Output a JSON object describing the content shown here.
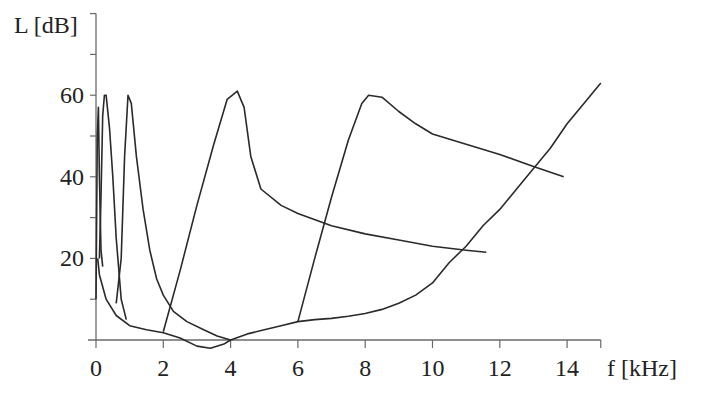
{
  "chart_data": {
    "type": "line",
    "title": "",
    "xlabel": "f [kHz]",
    "ylabel": "L [dB]",
    "xlim": [
      0,
      15
    ],
    "ylim": [
      0,
      80
    ],
    "grid": false,
    "legend": null,
    "x_ticks": [
      0,
      2,
      4,
      6,
      8,
      10,
      12,
      14
    ],
    "y_ticks_labeled": [
      20,
      40,
      60
    ],
    "y_ticks_minor": [
      10,
      30,
      50,
      70,
      80
    ],
    "series": [
      {
        "name": "threshold-in-quiet",
        "description": "Absolute hearing threshold curve",
        "points": [
          [
            0.05,
            20
          ],
          [
            0.1,
            16
          ],
          [
            0.3,
            10
          ],
          [
            0.6,
            6
          ],
          [
            1.0,
            3.5
          ],
          [
            1.5,
            2.5
          ],
          [
            2.0,
            1.8
          ],
          [
            2.5,
            0.5
          ],
          [
            3.0,
            -1.5
          ],
          [
            3.4,
            -2
          ],
          [
            3.8,
            -1
          ],
          [
            4.0,
            0
          ],
          [
            4.5,
            1.5
          ],
          [
            5.0,
            2.5
          ],
          [
            5.5,
            3.5
          ],
          [
            6.0,
            4.5
          ],
          [
            6.5,
            5
          ],
          [
            7.0,
            5.3
          ],
          [
            7.5,
            5.8
          ],
          [
            8.0,
            6.5
          ],
          [
            8.5,
            7.5
          ],
          [
            9.0,
            9
          ],
          [
            9.5,
            11
          ],
          [
            10.0,
            14
          ],
          [
            10.5,
            19
          ],
          [
            11.0,
            23
          ],
          [
            11.5,
            28
          ],
          [
            12.0,
            32
          ],
          [
            12.5,
            37
          ],
          [
            13.0,
            42
          ],
          [
            13.5,
            47
          ],
          [
            14.0,
            53
          ],
          [
            14.5,
            58
          ],
          [
            15.0,
            63
          ]
        ]
      },
      {
        "name": "masking-curve-0.07kHz",
        "masker_frequency_khz": 0.07,
        "peak_db": 57,
        "points": [
          [
            0.0,
            10
          ],
          [
            0.04,
            50
          ],
          [
            0.07,
            57
          ],
          [
            0.1,
            40
          ],
          [
            0.15,
            22
          ],
          [
            0.2,
            18
          ]
        ]
      },
      {
        "name": "masking-curve-0.25kHz",
        "masker_frequency_khz": 0.25,
        "peak_db": 60,
        "points": [
          [
            0.1,
            20
          ],
          [
            0.15,
            35
          ],
          [
            0.2,
            55
          ],
          [
            0.25,
            60
          ],
          [
            0.3,
            60
          ],
          [
            0.4,
            52
          ],
          [
            0.5,
            40
          ],
          [
            0.6,
            25
          ],
          [
            0.75,
            10
          ],
          [
            0.9,
            5
          ]
        ]
      },
      {
        "name": "masking-curve-1kHz",
        "masker_frequency_khz": 1.0,
        "peak_db": 60,
        "points": [
          [
            0.6,
            9
          ],
          [
            0.75,
            20
          ],
          [
            0.85,
            45
          ],
          [
            0.95,
            60
          ],
          [
            1.05,
            58
          ],
          [
            1.2,
            45
          ],
          [
            1.4,
            32
          ],
          [
            1.6,
            22
          ],
          [
            1.8,
            15
          ],
          [
            2.0,
            11
          ],
          [
            2.3,
            7
          ],
          [
            2.7,
            4.5
          ],
          [
            3.2,
            2.5
          ],
          [
            3.6,
            1
          ],
          [
            4.0,
            0
          ]
        ]
      },
      {
        "name": "masking-curve-4kHz",
        "masker_frequency_khz": 4.0,
        "peak_db": 61,
        "points": [
          [
            2.0,
            2
          ],
          [
            2.5,
            17
          ],
          [
            3.0,
            33
          ],
          [
            3.5,
            48
          ],
          [
            3.9,
            59
          ],
          [
            4.2,
            61
          ],
          [
            4.4,
            57
          ],
          [
            4.6,
            45
          ],
          [
            4.9,
            37
          ],
          [
            5.5,
            33
          ],
          [
            6.0,
            31
          ],
          [
            7.0,
            28
          ],
          [
            8.0,
            26
          ],
          [
            9.0,
            24.5
          ],
          [
            10.0,
            23
          ],
          [
            11.0,
            22
          ],
          [
            11.6,
            21.5
          ]
        ]
      },
      {
        "name": "masking-curve-8kHz",
        "masker_frequency_khz": 8.0,
        "peak_db": 60,
        "points": [
          [
            6.0,
            4.5
          ],
          [
            6.5,
            20
          ],
          [
            7.0,
            35
          ],
          [
            7.5,
            49
          ],
          [
            7.9,
            58
          ],
          [
            8.1,
            60
          ],
          [
            8.5,
            59.5
          ],
          [
            9.0,
            56
          ],
          [
            9.5,
            53
          ],
          [
            10.0,
            50.5
          ],
          [
            11.0,
            48
          ],
          [
            12.0,
            45.5
          ],
          [
            13.0,
            42.5
          ],
          [
            13.9,
            40
          ]
        ]
      }
    ]
  },
  "axes": {
    "ylabel": "L [dB]",
    "xlabel": "f [kHz]",
    "y_labels": [
      "20",
      "40",
      "60"
    ],
    "x_labels": [
      "0",
      "2",
      "4",
      "6",
      "8",
      "10",
      "12",
      "14"
    ]
  }
}
